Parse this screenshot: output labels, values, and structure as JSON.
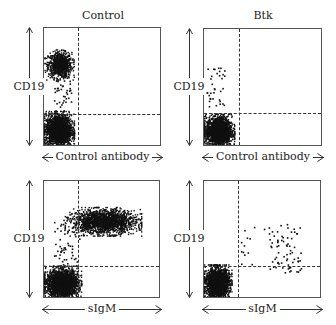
{
  "figure": {
    "columns": [
      "Control",
      "Btk"
    ],
    "y_axis_label": "CD19",
    "row_x_labels": [
      "Control antibody",
      "sIgM"
    ]
  },
  "chart_data": [
    {
      "type": "scatter",
      "title": "Control",
      "xlabel": "Control antibody",
      "ylabel": "CD19",
      "gates": {
        "x_fraction": 0.29,
        "y_fraction": 0.72
      },
      "populations": [
        {
          "name": "CD19+ population",
          "x_range": [
            0.02,
            0.24
          ],
          "y_range": [
            0.58,
            0.81
          ],
          "density": "dense",
          "count": 900
        },
        {
          "name": "CD19+ tail",
          "x_range": [
            0.08,
            0.23
          ],
          "y_range": [
            0.3,
            0.6
          ],
          "density": "sparse",
          "count": 40
        },
        {
          "name": "CD19- population",
          "x_range": [
            0.0,
            0.24
          ],
          "y_range": [
            0.0,
            0.29
          ],
          "density": "dense",
          "count": 2200
        }
      ]
    },
    {
      "type": "scatter",
      "title": "Btk",
      "xlabel": "Control antibody",
      "ylabel": "CD19",
      "gates": {
        "x_fraction": 0.29,
        "y_fraction": 0.71
      },
      "populations": [
        {
          "name": "CD19+ population",
          "x_range": [
            0.02,
            0.17
          ],
          "y_range": [
            0.32,
            0.68
          ],
          "density": "sparse",
          "count": 35
        },
        {
          "name": "CD19- population",
          "x_range": [
            0.0,
            0.24
          ],
          "y_range": [
            0.0,
            0.27
          ],
          "density": "dense",
          "count": 2000
        }
      ]
    },
    {
      "type": "scatter",
      "title": "Control",
      "xlabel": "sIgM",
      "ylabel": "CD19",
      "gates": {
        "x_fraction": 0.29,
        "y_fraction": 0.72
      },
      "populations": [
        {
          "name": "CD19+ sIgM+ population",
          "x_range": [
            0.22,
            0.8
          ],
          "y_range": [
            0.55,
            0.77
          ],
          "density": "dense",
          "count": 1800
        },
        {
          "name": "CD19+ sIgM- scatter",
          "x_range": [
            0.08,
            0.3
          ],
          "y_range": [
            0.28,
            0.75
          ],
          "density": "sparse",
          "count": 60
        },
        {
          "name": "CD19- population",
          "x_range": [
            0.0,
            0.3
          ],
          "y_range": [
            0.0,
            0.27
          ],
          "density": "dense",
          "count": 2200
        }
      ]
    },
    {
      "type": "scatter",
      "title": "Btk",
      "xlabel": "sIgM",
      "ylabel": "CD19",
      "gates": {
        "x_fraction": 0.29,
        "y_fraction": 0.72
      },
      "populations": [
        {
          "name": "CD19+ sIgM+ population",
          "x_range": [
            0.55,
            0.82
          ],
          "y_range": [
            0.22,
            0.65
          ],
          "density": "sparse",
          "count": 70
        },
        {
          "name": "CD19+ sIgM low scatter",
          "x_range": [
            0.3,
            0.55
          ],
          "y_range": [
            0.25,
            0.62
          ],
          "density": "sparse",
          "count": 15
        },
        {
          "name": "CD19- population",
          "x_range": [
            0.0,
            0.22
          ],
          "y_range": [
            0.0,
            0.28
          ],
          "density": "dense",
          "count": 2000
        }
      ]
    }
  ]
}
